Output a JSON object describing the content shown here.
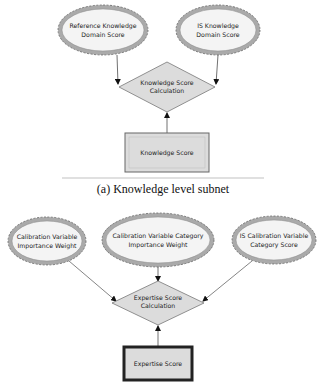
{
  "subnets": [
    {
      "caption": "(a) Knowledge level subnet",
      "inputs": [
        {
          "line1": "Reference Knowledge",
          "line2": "Domain Score"
        },
        {
          "line1": "IS Knowledge",
          "line2": "Domain Score"
        }
      ],
      "calculation": {
        "line1": "Knowledge Score",
        "line2": "Calculation"
      },
      "output": {
        "label": "Knowledge Score"
      }
    },
    {
      "inputs": [
        {
          "line1": "Calibration Variable",
          "line2": "Importance Weight"
        },
        {
          "line1": "Calibration Variable Category",
          "line2": "Importance Weight"
        },
        {
          "line1": "IS Calibration Variable",
          "line2": "Category Score"
        }
      ],
      "calculation": {
        "line1": "Expertise Score",
        "line2": "Calculation"
      },
      "output": {
        "label": "Expertise Score"
      }
    }
  ],
  "colors": {
    "ellipse_fill": "#f4f4f4",
    "ellipse_ring": "#aaaaaa",
    "node_fill": "#dcdcdc",
    "stroke": "#555555"
  }
}
